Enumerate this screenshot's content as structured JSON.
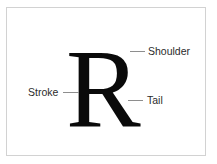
{
  "diagram": {
    "specimen": {
      "glyph": "R",
      "name": "capital-r-specimen"
    },
    "frame": {
      "border_color": "#d2d2d2",
      "background_color": "#ffffff"
    },
    "colors": {
      "glyph": "#0a0a0a",
      "label_text": "#2b2b2b",
      "leader_line": "#8e8e8e",
      "page_background": "#ffffff"
    },
    "callouts": [
      {
        "id": "shoulder",
        "label": "Shoulder",
        "leader": "line-segment",
        "side": "right"
      },
      {
        "id": "stroke",
        "label": "Stroke",
        "leader": "line-segment",
        "side": "left"
      },
      {
        "id": "tail",
        "label": "Tail",
        "leader": "line-segment",
        "side": "right"
      }
    ]
  }
}
